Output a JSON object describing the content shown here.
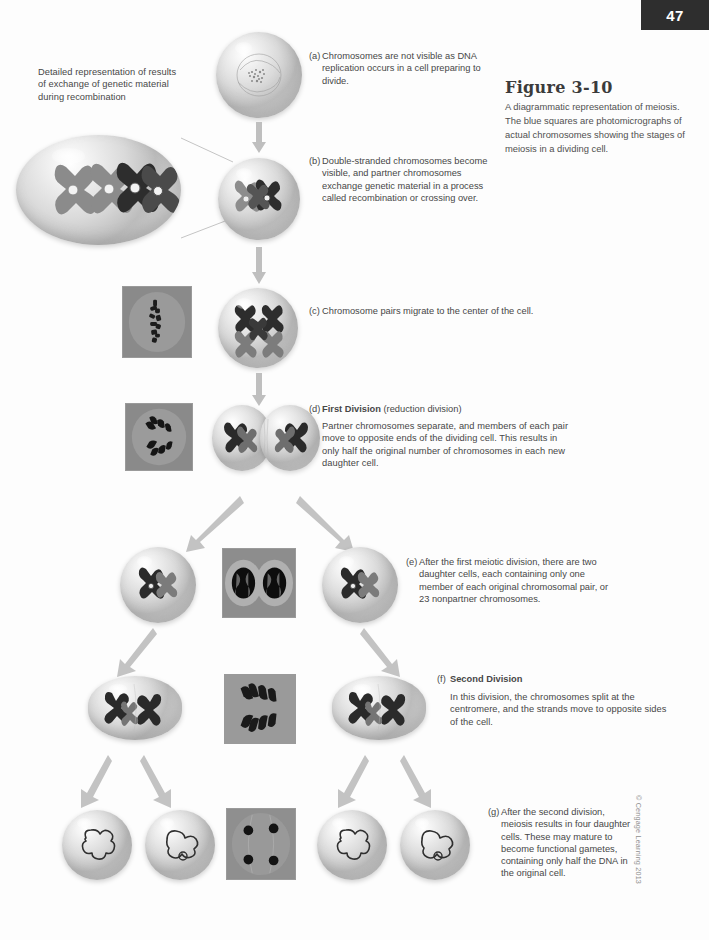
{
  "page": {
    "number": "47",
    "copyright": "© Cengage Learning 2013"
  },
  "figure": {
    "title": "Figure 3-10",
    "caption": "A diagrammatic representation of meiosis. The blue squares are photomicrographs of actual chromosomes showing the stages of meiosis in a dividing cell."
  },
  "callouts": {
    "detail_note": "Detailed representation of results of exchange of genetic material during recombination"
  },
  "steps": [
    {
      "id": "a",
      "label": "(a)",
      "heading": "",
      "text": "Chromosomes are not visible as DNA replication occurs in a cell preparing to divide."
    },
    {
      "id": "b",
      "label": "(b)",
      "heading": "",
      "text": "Double-stranded chromosomes become visible, and partner chromosomes exchange genetic material in a process called recombination or crossing over."
    },
    {
      "id": "c",
      "label": "(c)",
      "heading": "",
      "text": "Chromosome pairs migrate to the center of the cell."
    },
    {
      "id": "d",
      "label": "(d)",
      "heading": "First Division",
      "heading_suffix": "(reduction division)",
      "text": "Partner chromosomes separate, and members of each pair move to opposite ends of the dividing cell. This results in only half the original number of chromosomes in each new daughter cell."
    },
    {
      "id": "e",
      "label": "(e)",
      "heading": "",
      "text": "After the first meiotic division, there are two daughter cells, each containing only one member of each original chromosomal pair, or 23 nonpartner chromosomes."
    },
    {
      "id": "f",
      "label": "(f)",
      "heading": "Second Division",
      "heading_suffix": "",
      "text": "In this division, the chromosomes split at the centromere, and the strands move to opposite sides of the cell."
    },
    {
      "id": "g",
      "label": "(g)",
      "heading": "",
      "text": "After the second division, meiosis results in four daughter cells. These may mature to become functional gametes, containing only half the DNA in the original cell."
    }
  ],
  "colors": {
    "badge_bg": "#2e2e2e",
    "badge_text": "#ffffff",
    "body_text": "#474747",
    "caption_text": "#505050",
    "arrow": "#b9b9b9",
    "chromosome_dark": "#2b2b2b",
    "chromosome_light": "#8c8c8c",
    "micro_bg": "#7d7d7d"
  }
}
